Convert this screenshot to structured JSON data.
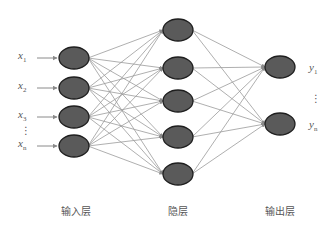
{
  "diagram": {
    "type": "neural-network",
    "layers": [
      {
        "name": "input",
        "label": "输入层",
        "nodes": 4,
        "x": 74,
        "ys": [
          58,
          88,
          117,
          146
        ]
      },
      {
        "name": "hidden",
        "label": "隐层",
        "nodes": 5,
        "x": 178,
        "ys": [
          30,
          68,
          101,
          137,
          174
        ]
      },
      {
        "name": "output",
        "label": "输出层",
        "nodes": 2,
        "x": 280,
        "ys": [
          67,
          124
        ]
      }
    ],
    "inputs": [
      {
        "base": "x",
        "sub": "1"
      },
      {
        "base": "x",
        "sub": "2"
      },
      {
        "base": "x",
        "sub": "3"
      },
      {
        "base": "x",
        "sub": "n"
      }
    ],
    "outputs": [
      {
        "base": "y",
        "sub": "1"
      },
      {
        "base": "y",
        "sub": "n"
      }
    ],
    "ellipsis": "⋮",
    "colors": {
      "node_fill": "#5a5a5a",
      "node_stroke": "#1e1e1e",
      "edge": "#9a9a9a",
      "arrow": "#8a8a8a",
      "text": "#555555"
    }
  }
}
